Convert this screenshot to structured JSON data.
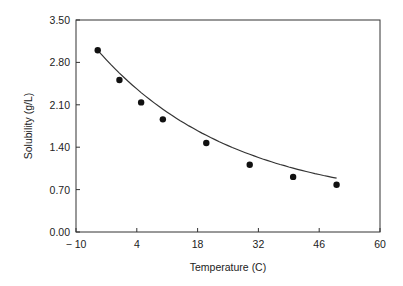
{
  "chart_data": {
    "type": "scatter",
    "title": "",
    "xlabel": "Temperature (C)",
    "ylabel": "Solubility (g/L)",
    "xlim": [
      -10,
      60
    ],
    "ylim": [
      0,
      3.5
    ],
    "x_ticks": [
      "-10",
      "4",
      "18",
      "32",
      "46",
      "60"
    ],
    "y_ticks": [
      "0.00",
      "0.70",
      "1.40",
      "2.10",
      "2.80",
      "3.50"
    ],
    "grid": false,
    "legend": null,
    "series": [
      {
        "name": "measured",
        "marker": "filled-circle",
        "x": [
          -5,
          0,
          5,
          10,
          20,
          30,
          40,
          50
        ],
        "y": [
          3.0,
          2.51,
          2.14,
          1.86,
          1.47,
          1.11,
          0.91,
          0.78
        ]
      },
      {
        "name": "fit",
        "style": "line",
        "x_range": [
          -5,
          50
        ]
      }
    ]
  }
}
